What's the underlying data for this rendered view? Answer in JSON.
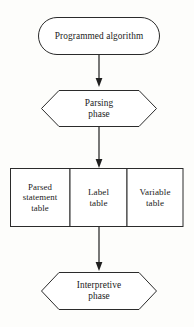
{
  "diagram": {
    "type": "flowchart",
    "orientation": "top-to-bottom",
    "title": "",
    "background_color": "#fdfdfb",
    "stroke_color": "#2b2b2b",
    "text_color": "#1a1a1a",
    "nodes": [
      {
        "id": "programmed-algorithm",
        "shape": "stadium",
        "lines": [
          "Programmed algorithm"
        ]
      },
      {
        "id": "parsing-phase",
        "shape": "hexagon",
        "lines": [
          "Parsing",
          "phase"
        ]
      },
      {
        "id": "parsed-statement-table",
        "shape": "rectangle",
        "lines": [
          "Parsed",
          "statement",
          "table"
        ]
      },
      {
        "id": "label-table",
        "shape": "rectangle",
        "lines": [
          "Label",
          "table"
        ]
      },
      {
        "id": "variable-table",
        "shape": "rectangle",
        "lines": [
          "Variable",
          "table"
        ]
      },
      {
        "id": "interpretive-phase",
        "shape": "hexagon",
        "lines": [
          "Interpretive",
          "phase"
        ]
      }
    ],
    "edges": [
      {
        "id": "edge-algorithm-to-parsing",
        "from": "programmed-algorithm",
        "to": "parsing-phase",
        "arrow": "down"
      },
      {
        "id": "edge-parsing-to-tables",
        "from": "parsing-phase",
        "to": "label-table",
        "arrow": "down"
      },
      {
        "id": "edge-tables-to-interpretive",
        "from": "label-table",
        "to": "interpretive-phase",
        "arrow": "down"
      }
    ]
  }
}
